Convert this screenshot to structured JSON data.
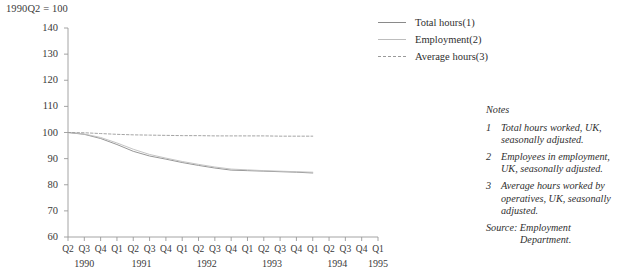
{
  "index_note": "1990Q2 = 100",
  "legend": {
    "items": [
      {
        "label": "Total hours(1)",
        "style": "solid-dark",
        "color": "#8a8a8a"
      },
      {
        "label": "Employment(2)",
        "style": "solid-light",
        "color": "#bdbdbd"
      },
      {
        "label": "Average hours(3)",
        "style": "dashed",
        "color": "#9a9a9a"
      }
    ]
  },
  "notes": {
    "heading": "Notes",
    "items": [
      {
        "num": "1",
        "text": "Total hours worked, UK, seasonally adjusted."
      },
      {
        "num": "2",
        "text": "Employees in employment, UK, seasonally adjusted."
      },
      {
        "num": "3",
        "text": "Average hours worked by operatives, UK, seasonally adjusted."
      }
    ],
    "source_label": "Source: Employment",
    "source_cont": "Department."
  },
  "chart_data": {
    "type": "line",
    "title": "1990Q2 = 100",
    "xlabel": "",
    "ylabel": "",
    "ylim": [
      60,
      140
    ],
    "yticks": [
      60,
      70,
      80,
      90,
      100,
      110,
      120,
      130,
      140
    ],
    "grid": false,
    "legend_position": "top-right",
    "x": [
      "1990Q2",
      "1990Q3",
      "1990Q4",
      "1991Q1",
      "1991Q2",
      "1991Q3",
      "1991Q4",
      "1992Q1",
      "1992Q2",
      "1992Q3",
      "1992Q4",
      "1993Q1",
      "1993Q2",
      "1993Q3",
      "1993Q4",
      "1994Q1",
      "1994Q2",
      "1994Q3",
      "1994Q4",
      "1995Q1"
    ],
    "x_tick_labels": [
      "Q2",
      "Q3",
      "Q4",
      "Q1",
      "Q2",
      "Q3",
      "Q4",
      "Q1",
      "Q2",
      "Q3",
      "Q4",
      "Q1",
      "Q2",
      "Q3",
      "Q4",
      "Q1",
      "Q2",
      "Q3",
      "Q4",
      "Q1"
    ],
    "x_year_labels": [
      "1990",
      "1991",
      "1992",
      "1993",
      "1994",
      "1995"
    ],
    "series": [
      {
        "name": "Total hours(1)",
        "style": "solid",
        "color": "#8a8a8a",
        "values": [
          100.0,
          99.3,
          97.7,
          95.4,
          92.8,
          91.0,
          89.8,
          88.5,
          87.4,
          86.4,
          85.6,
          85.4,
          85.2,
          85.0,
          84.8,
          84.5,
          null,
          null,
          null,
          null
        ]
      },
      {
        "name": "Employment(2)",
        "style": "solid",
        "color": "#bdbdbd",
        "values": [
          100.0,
          99.4,
          98.1,
          96.0,
          93.6,
          91.6,
          90.2,
          88.9,
          87.8,
          86.8,
          86.0,
          85.7,
          85.4,
          85.2,
          85.0,
          84.8,
          null,
          null,
          null,
          null
        ]
      },
      {
        "name": "Average hours(3)",
        "style": "dashed",
        "color": "#9a9a9a",
        "values": [
          100.0,
          99.9,
          99.6,
          99.3,
          99.1,
          99.0,
          98.9,
          98.8,
          98.8,
          98.7,
          98.7,
          98.7,
          98.7,
          98.6,
          98.6,
          98.6,
          null,
          null,
          null,
          null
        ]
      }
    ]
  }
}
